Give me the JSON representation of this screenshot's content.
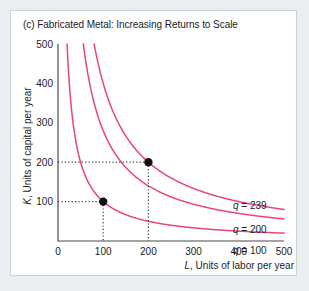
{
  "figure": {
    "title": "(c) Fabricated Metal: Increasing Returns to Scale",
    "background_color": "#e9eff1",
    "panel_color": "#ffffff",
    "panel_border_color": "#c8d4d8"
  },
  "chart_data": {
    "type": "line",
    "title": "(c) Fabricated Metal: Increasing Returns to Scale",
    "xlabel": "L, Units of labor per year",
    "ylabel": "K, Units of capital per year",
    "xlabel_italic_prefix": "L",
    "xlabel_rest": ", Units of labor per year",
    "ylabel_italic_prefix": "K",
    "ylabel_rest": ", Units of capital per year",
    "xlim": [
      0,
      500
    ],
    "ylim": [
      0,
      500
    ],
    "xticks": [
      0,
      100,
      200,
      300,
      400,
      500
    ],
    "xticklabels": [
      "0",
      "100",
      "200",
      "300",
      "400",
      "500"
    ],
    "yticks": [
      100,
      200,
      300,
      400,
      500
    ],
    "yticklabels": [
      "100",
      "200",
      "300",
      "400",
      "500"
    ],
    "grid": false,
    "curve_color": "#e8447f",
    "legend_position": "inline-right",
    "series": [
      {
        "name": "q = 239",
        "label": "q = 239",
        "label_italic_prefix": "q",
        "label_rest": " = 239",
        "constant": 40000,
        "points": [
          {
            "x": 200,
            "y": 200
          }
        ]
      },
      {
        "name": "q = 200",
        "label": "q = 200",
        "label_italic_prefix": "q",
        "label_rest": " = 200",
        "constant": 28000,
        "points": []
      },
      {
        "name": "q = 100",
        "label": "q = 100",
        "label_italic_prefix": "q",
        "label_rest": " = 100",
        "constant": 10000,
        "points": [
          {
            "x": 100,
            "y": 100
          }
        ]
      }
    ],
    "annotated_points": [
      {
        "label": "point-a",
        "x": 100,
        "y": 100,
        "on_curve": "q = 100"
      },
      {
        "label": "point-b",
        "x": 200,
        "y": 200,
        "on_curve": "q = 239"
      }
    ],
    "guide_lines": [
      {
        "from": {
          "x": 0,
          "y": 100
        },
        "to": {
          "x": 100,
          "y": 100
        }
      },
      {
        "from": {
          "x": 100,
          "y": 100
        },
        "to": {
          "x": 100,
          "y": 0
        }
      },
      {
        "from": {
          "x": 0,
          "y": 200
        },
        "to": {
          "x": 200,
          "y": 200
        }
      },
      {
        "from": {
          "x": 200,
          "y": 200
        },
        "to": {
          "x": 200,
          "y": 0
        }
      }
    ]
  }
}
